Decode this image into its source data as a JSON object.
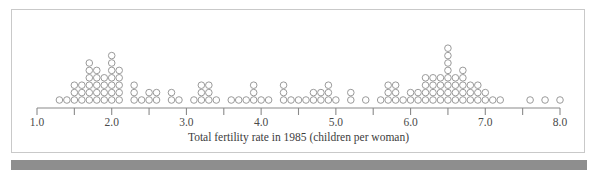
{
  "figure": {
    "background_color": "#ffffff",
    "panel_border_color": "#c9c9c9",
    "bottom_bar_color": "#8e8e8e"
  },
  "chart_data": {
    "type": "dotplot",
    "title": "",
    "xlabel": "Total fertility rate in 1985 (children per woman)",
    "ylabel": "",
    "xlim": [
      1.0,
      8.0
    ],
    "xticks": [
      1.0,
      1.5,
      2.0,
      2.5,
      3.0,
      3.5,
      4.0,
      4.5,
      5.0,
      5.5,
      6.0,
      6.5,
      7.0,
      7.5,
      8.0
    ],
    "xtick_labels": [
      "1.0",
      "",
      "2.0",
      "",
      "3.0",
      "",
      "4.0",
      "",
      "5.0",
      "",
      "6.0",
      "",
      "7.0",
      "",
      "8.0"
    ],
    "major_xticks": [
      1.0,
      2.0,
      3.0,
      4.0,
      5.0,
      6.0,
      7.0,
      8.0
    ],
    "grid": false,
    "legend": null,
    "dot_color": "#9a9a9a",
    "dot_fill": "none",
    "bin_width": 0.1,
    "total_count": 173,
    "stacks": [
      {
        "x": 1.3,
        "count": 1
      },
      {
        "x": 1.4,
        "count": 1
      },
      {
        "x": 1.5,
        "count": 3
      },
      {
        "x": 1.6,
        "count": 3
      },
      {
        "x": 1.7,
        "count": 6
      },
      {
        "x": 1.8,
        "count": 5
      },
      {
        "x": 1.9,
        "count": 4
      },
      {
        "x": 2.0,
        "count": 7
      },
      {
        "x": 2.1,
        "count": 5
      },
      {
        "x": 2.3,
        "count": 3
      },
      {
        "x": 2.4,
        "count": 1
      },
      {
        "x": 2.5,
        "count": 2
      },
      {
        "x": 2.6,
        "count": 2
      },
      {
        "x": 2.8,
        "count": 2
      },
      {
        "x": 2.9,
        "count": 1
      },
      {
        "x": 3.1,
        "count": 1
      },
      {
        "x": 3.2,
        "count": 3
      },
      {
        "x": 3.3,
        "count": 3
      },
      {
        "x": 3.4,
        "count": 1
      },
      {
        "x": 3.6,
        "count": 1
      },
      {
        "x": 3.7,
        "count": 1
      },
      {
        "x": 3.8,
        "count": 1
      },
      {
        "x": 3.9,
        "count": 3
      },
      {
        "x": 4.0,
        "count": 1
      },
      {
        "x": 4.1,
        "count": 1
      },
      {
        "x": 4.3,
        "count": 3
      },
      {
        "x": 4.4,
        "count": 1
      },
      {
        "x": 4.5,
        "count": 1
      },
      {
        "x": 4.6,
        "count": 1
      },
      {
        "x": 4.7,
        "count": 2
      },
      {
        "x": 4.8,
        "count": 2
      },
      {
        "x": 4.9,
        "count": 3
      },
      {
        "x": 5.0,
        "count": 1
      },
      {
        "x": 5.2,
        "count": 2
      },
      {
        "x": 5.4,
        "count": 1
      },
      {
        "x": 5.6,
        "count": 1
      },
      {
        "x": 5.7,
        "count": 3
      },
      {
        "x": 5.8,
        "count": 3
      },
      {
        "x": 5.9,
        "count": 1
      },
      {
        "x": 6.0,
        "count": 2
      },
      {
        "x": 6.1,
        "count": 2
      },
      {
        "x": 6.2,
        "count": 4
      },
      {
        "x": 6.3,
        "count": 4
      },
      {
        "x": 6.4,
        "count": 4
      },
      {
        "x": 6.5,
        "count": 8
      },
      {
        "x": 6.6,
        "count": 4
      },
      {
        "x": 6.7,
        "count": 5
      },
      {
        "x": 6.8,
        "count": 3
      },
      {
        "x": 6.9,
        "count": 3
      },
      {
        "x": 7.0,
        "count": 2
      },
      {
        "x": 7.1,
        "count": 1
      },
      {
        "x": 7.2,
        "count": 1
      },
      {
        "x": 7.6,
        "count": 1
      },
      {
        "x": 7.8,
        "count": 1
      },
      {
        "x": 8.0,
        "count": 1
      }
    ]
  },
  "geometry": {
    "x_pixel_at_min": 37,
    "x_pixel_at_max": 560,
    "baseline_y": 100,
    "dot_radius": 3.3,
    "dot_pitch_y": 7.4,
    "axis_y": 108,
    "tick_length": 7,
    "tick_label_y": 126,
    "axis_title_y": 141
  }
}
